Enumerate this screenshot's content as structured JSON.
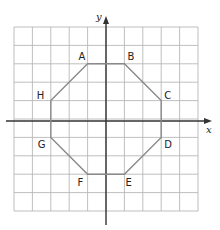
{
  "diagram": {
    "type": "coordinate-grid-polygon",
    "grid": {
      "cols": 10,
      "rows": 10,
      "x_min": -5,
      "x_max": 5,
      "y_min": -5,
      "y_max": 5,
      "line_color": "#b8b8b8"
    },
    "axes": {
      "x_label": "x",
      "y_label": "y",
      "color": "#333333"
    },
    "polygon": {
      "name": "octagon",
      "stroke_color": "#8a8a8a",
      "vertices": [
        {
          "label": "A",
          "x": -1,
          "y": 3
        },
        {
          "label": "B",
          "x": 1,
          "y": 3
        },
        {
          "label": "C",
          "x": 3,
          "y": 1
        },
        {
          "label": "D",
          "x": 3,
          "y": -1
        },
        {
          "label": "E",
          "x": 1,
          "y": -3
        },
        {
          "label": "F",
          "x": -1,
          "y": -3
        },
        {
          "label": "G",
          "x": -3,
          "y": -1
        },
        {
          "label": "H",
          "x": -3,
          "y": 1
        }
      ]
    }
  }
}
